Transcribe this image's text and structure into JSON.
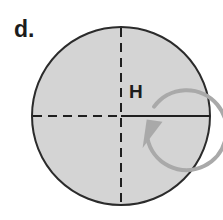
{
  "figure": {
    "panel_label": "d.",
    "field_label": "H",
    "background_color": "#ffffff",
    "disk": {
      "fill_color": "#d4d4d4",
      "stroke_color": "#2b2b2b",
      "stroke_width": 2,
      "center_x": 121,
      "center_y": 116,
      "radius": 89
    },
    "axes": {
      "horizontal_left_style": "dashed",
      "horizontal_right_style": "solid",
      "vertical_style": "dashed",
      "stroke_color": "#1f1f1f",
      "stroke_width": 2,
      "dash_pattern": "9 6"
    },
    "rotation_arrow": {
      "direction": "clockwise",
      "stroke_color": "#a9a9a9",
      "stroke_width": 4,
      "center_x": 115,
      "center_y": 115,
      "radius": 40,
      "arrowhead_angle_deg": 20
    },
    "panel_label_position": {
      "x": 14,
      "y": 37
    },
    "field_label_position": {
      "x": 129,
      "y": 98
    }
  }
}
